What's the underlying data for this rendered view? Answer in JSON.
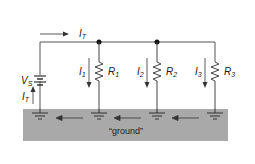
{
  "diagram": {
    "type": "parallel-circuit",
    "colors": {
      "wire": "#555555",
      "ground_band": "#a9a9a9",
      "text": "#222222",
      "node": "#111111"
    },
    "source": {
      "label": "V",
      "sub": "S"
    },
    "total_current_top": {
      "label": "I",
      "sub": "T"
    },
    "total_current_return": {
      "label": "I",
      "sub": "T"
    },
    "branches": [
      {
        "current": "I",
        "current_sub": "1",
        "resistor": "R",
        "resistor_sub": "1"
      },
      {
        "current": "I",
        "current_sub": "2",
        "resistor": "R",
        "resistor_sub": "2"
      },
      {
        "current": "I",
        "current_sub": "3",
        "resistor": "R",
        "resistor_sub": "3"
      }
    ],
    "ground_label": "“ground”"
  }
}
